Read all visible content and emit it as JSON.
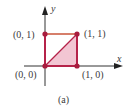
{
  "figure": {
    "caption": "(a)",
    "axes": {
      "x_label": "x",
      "y_label": "y"
    },
    "points": [
      {
        "label": "(0, 0)",
        "x": 0,
        "y": 0
      },
      {
        "label": "(1, 0)",
        "x": 1,
        "y": 0
      },
      {
        "label": "(1, 1)",
        "x": 1,
        "y": 1
      },
      {
        "label": "(0, 1)",
        "x": 0,
        "y": 1
      }
    ],
    "shaded_region": "triangle (0,0)-(1,0)-(1,1)",
    "colors": {
      "square_edge": "#b5234a",
      "top_edge": "#c8553a",
      "fill": "#f2c6d3",
      "point": "#a81c3e",
      "axis": "#333333"
    }
  }
}
